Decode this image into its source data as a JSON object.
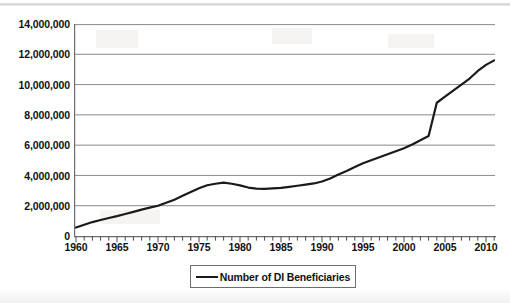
{
  "chart_data": {
    "type": "line",
    "title": "",
    "xlabel": "",
    "ylabel": "",
    "xlim": [
      1960,
      2011
    ],
    "ylim": [
      0,
      14000000
    ],
    "ytick_labels": [
      "14,000,000",
      "12,000,000",
      "10,000,000",
      "8,000,000",
      "6,000,000",
      "4,000,000",
      "2,000,000",
      "0"
    ],
    "ytick_values": [
      14000000,
      12000000,
      10000000,
      8000000,
      6000000,
      4000000,
      2000000,
      0
    ],
    "xtick_labels": [
      "1960",
      "1965",
      "1970",
      "1975",
      "1980",
      "1985",
      "1990",
      "1995",
      "2000",
      "2005",
      "2010"
    ],
    "xtick_values": [
      1960,
      1965,
      1970,
      1975,
      1980,
      1985,
      1990,
      1995,
      2000,
      2005,
      2010
    ],
    "minor_xtick_interval": 1,
    "grid": "horizontal",
    "legend_position": "bottom-center",
    "series": [
      {
        "name": "Number of DI Beneficiaries",
        "color": "#1a1a1a",
        "x": [
          1960,
          1961,
          1962,
          1963,
          1964,
          1965,
          1966,
          1967,
          1968,
          1969,
          1970,
          1971,
          1972,
          1973,
          1974,
          1975,
          1976,
          1977,
          1978,
          1979,
          1980,
          1981,
          1982,
          1983,
          1984,
          1985,
          1986,
          1987,
          1988,
          1989,
          1990,
          1991,
          1992,
          1993,
          1994,
          1995,
          1996,
          1997,
          1998,
          1999,
          2000,
          2001,
          2002,
          2003,
          2004,
          2005,
          2006,
          2007,
          2008,
          2009,
          2010,
          2011
        ],
        "values": [
          560000,
          740000,
          920000,
          1060000,
          1190000,
          1310000,
          1450000,
          1590000,
          1740000,
          1870000,
          2000000,
          2200000,
          2400000,
          2650000,
          2900000,
          3150000,
          3350000,
          3450000,
          3520000,
          3450000,
          3340000,
          3200000,
          3130000,
          3110000,
          3140000,
          3180000,
          3250000,
          3320000,
          3390000,
          3470000,
          3600000,
          3800000,
          4060000,
          4300000,
          4560000,
          4800000,
          5000000,
          5200000,
          5400000,
          5600000,
          5800000,
          6040000,
          6320000,
          6600000,
          8800000,
          9200000,
          9600000,
          10000000,
          10400000,
          10900000,
          11300000,
          11600000
        ]
      }
    ]
  },
  "legend": {
    "label": "Number of DI Beneficiaries"
  }
}
